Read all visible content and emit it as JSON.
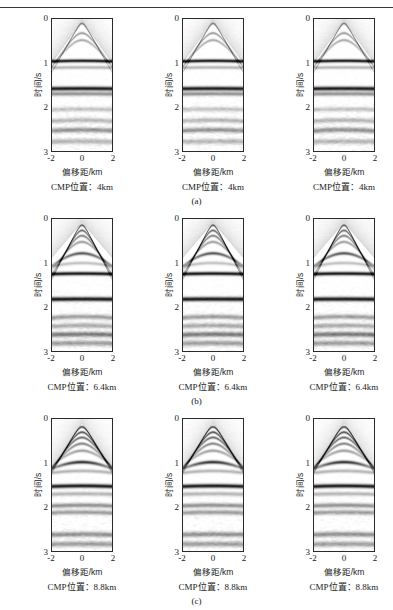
{
  "figure": {
    "rule": true,
    "axis": {
      "ylabel": "时间/s",
      "xlabel": "偏移距/km",
      "yticks": [
        "0",
        "1",
        "2",
        "3"
      ],
      "xticks": [
        "-2",
        "0",
        "2"
      ],
      "ylim": [
        0,
        3
      ],
      "xlim": [
        -2,
        2
      ]
    },
    "rows": [
      {
        "subcaption": "(a)",
        "cmp_label": "CMP位置：4km",
        "cmp_value": "4km",
        "panels": [
          {
            "cmp_label": "CMP位置：4km"
          },
          {
            "cmp_label": "CMP位置：4km"
          },
          {
            "cmp_label": "CMP位置：4km"
          }
        ]
      },
      {
        "subcaption": "(b)",
        "cmp_label": "CMP位置：6.4km",
        "cmp_value": "6.4km",
        "panels": [
          {
            "cmp_label": "CMP位置：6.4km"
          },
          {
            "cmp_label": "CMP位置：6.4km"
          },
          {
            "cmp_label": "CMP位置：6.4km"
          }
        ]
      },
      {
        "subcaption": "(c)",
        "cmp_label": "CMP位置：8.8km",
        "cmp_value": "8.8km",
        "panels": [
          {
            "cmp_label": "CMP位置：8.8km"
          },
          {
            "cmp_label": "CMP位置：8.8km"
          },
          {
            "cmp_label": "CMP位置：8.8km"
          }
        ]
      }
    ]
  },
  "chart_data": {
    "type": "heatmap",
    "title": "",
    "xlabel": "偏移距/km",
    "ylabel": "时间/s",
    "xlim": [
      -2,
      2
    ],
    "ylim": [
      0,
      3
    ],
    "xticks": [
      -2,
      0,
      2
    ],
    "yticks": [
      0,
      1,
      2,
      3
    ],
    "grid": false,
    "legend": null,
    "colormap": "grayscale",
    "panel_grid": {
      "rows": 3,
      "cols": 3
    },
    "row_labels": [
      "(a)",
      "(b)",
      "(c)"
    ],
    "row_cmp_positions_km": [
      4,
      6.4,
      8.8
    ],
    "panels": [
      {
        "row": 0,
        "col": 0,
        "cmp_km": 4,
        "reflectors": [
          {
            "t0": 0.1,
            "type": "hyperbola",
            "strength": 0.55,
            "curvature": 0.3
          },
          {
            "t0": 0.32,
            "type": "hyperbola",
            "strength": 0.4,
            "curvature": 0.26
          },
          {
            "t0": 0.48,
            "type": "hyperbola",
            "strength": 0.35,
            "curvature": 0.24
          },
          {
            "t0": 0.95,
            "type": "flat",
            "strength": 0.95,
            "curvature": 0.04
          },
          {
            "t0": 1.1,
            "type": "flat",
            "strength": 0.3,
            "curvature": 0.03
          },
          {
            "t0": 1.58,
            "type": "flat",
            "strength": 0.95,
            "curvature": 0.03
          },
          {
            "t0": 1.7,
            "type": "flat",
            "strength": 0.45,
            "curvature": 0.03
          },
          {
            "t0": 2.05,
            "type": "flat",
            "strength": 0.25,
            "curvature": 0.05
          },
          {
            "t0": 2.3,
            "type": "flat",
            "strength": 0.3,
            "curvature": 0.08
          },
          {
            "t0": 2.52,
            "type": "flat",
            "strength": 0.45,
            "curvature": 0.08
          },
          {
            "t0": 2.78,
            "type": "flat",
            "strength": 0.3,
            "curvature": 0.06
          }
        ],
        "fan_apex_t": 0.02,
        "fan_span_t": 0.95,
        "noise": 0.16
      },
      {
        "row": 0,
        "col": 1,
        "cmp_km": 4,
        "reflectors": [
          {
            "t0": 0.1,
            "type": "hyperbola",
            "strength": 0.55,
            "curvature": 0.3
          },
          {
            "t0": 0.32,
            "type": "hyperbola",
            "strength": 0.4,
            "curvature": 0.26
          },
          {
            "t0": 0.48,
            "type": "hyperbola",
            "strength": 0.35,
            "curvature": 0.24
          },
          {
            "t0": 0.95,
            "type": "flat",
            "strength": 0.95,
            "curvature": 0.04
          },
          {
            "t0": 1.1,
            "type": "flat",
            "strength": 0.3,
            "curvature": 0.03
          },
          {
            "t0": 1.58,
            "type": "flat",
            "strength": 0.95,
            "curvature": 0.03
          },
          {
            "t0": 1.7,
            "type": "flat",
            "strength": 0.45,
            "curvature": 0.03
          },
          {
            "t0": 2.05,
            "type": "flat",
            "strength": 0.25,
            "curvature": 0.05
          },
          {
            "t0": 2.3,
            "type": "flat",
            "strength": 0.3,
            "curvature": 0.08
          },
          {
            "t0": 2.52,
            "type": "flat",
            "strength": 0.45,
            "curvature": 0.08
          },
          {
            "t0": 2.78,
            "type": "flat",
            "strength": 0.3,
            "curvature": 0.06
          }
        ],
        "fan_apex_t": 0.02,
        "fan_span_t": 0.95,
        "noise": 0.16
      },
      {
        "row": 0,
        "col": 2,
        "cmp_km": 4,
        "reflectors": [
          {
            "t0": 0.1,
            "type": "hyperbola",
            "strength": 0.55,
            "curvature": 0.3
          },
          {
            "t0": 0.32,
            "type": "hyperbola",
            "strength": 0.4,
            "curvature": 0.26
          },
          {
            "t0": 0.48,
            "type": "hyperbola",
            "strength": 0.35,
            "curvature": 0.24
          },
          {
            "t0": 0.95,
            "type": "flat",
            "strength": 0.95,
            "curvature": 0.04
          },
          {
            "t0": 1.1,
            "type": "flat",
            "strength": 0.3,
            "curvature": 0.03
          },
          {
            "t0": 1.58,
            "type": "flat",
            "strength": 0.95,
            "curvature": 0.03
          },
          {
            "t0": 1.7,
            "type": "flat",
            "strength": 0.45,
            "curvature": 0.03
          },
          {
            "t0": 2.05,
            "type": "flat",
            "strength": 0.25,
            "curvature": 0.05
          },
          {
            "t0": 2.3,
            "type": "flat",
            "strength": 0.3,
            "curvature": 0.08
          },
          {
            "t0": 2.52,
            "type": "flat",
            "strength": 0.45,
            "curvature": 0.08
          },
          {
            "t0": 2.78,
            "type": "flat",
            "strength": 0.3,
            "curvature": 0.06
          }
        ],
        "fan_apex_t": 0.02,
        "fan_span_t": 0.95,
        "noise": 0.16
      },
      {
        "row": 1,
        "col": 0,
        "cmp_km": 6.4,
        "reflectors": [
          {
            "t0": 0.14,
            "type": "hyperbola",
            "strength": 0.7,
            "curvature": 0.34
          },
          {
            "t0": 0.26,
            "type": "hyperbola",
            "strength": 0.6,
            "curvature": 0.32
          },
          {
            "t0": 0.38,
            "type": "hyperbola",
            "strength": 0.5,
            "curvature": 0.3
          },
          {
            "t0": 0.52,
            "type": "hyperbola",
            "strength": 0.4,
            "curvature": 0.26
          },
          {
            "t0": 0.78,
            "type": "hyperbola",
            "strength": 0.7,
            "curvature": 0.18
          },
          {
            "t0": 1.0,
            "type": "flat",
            "strength": 0.25,
            "curvature": 0.1
          },
          {
            "t0": 1.24,
            "type": "flat",
            "strength": 0.95,
            "curvature": 0.04
          },
          {
            "t0": 1.82,
            "type": "flat",
            "strength": 0.95,
            "curvature": 0.03
          },
          {
            "t0": 2.22,
            "type": "flat",
            "strength": 0.4,
            "curvature": 0.08
          },
          {
            "t0": 2.42,
            "type": "flat",
            "strength": 0.35,
            "curvature": 0.08
          },
          {
            "t0": 2.62,
            "type": "flat",
            "strength": 0.55,
            "curvature": 0.06
          },
          {
            "t0": 2.82,
            "type": "flat",
            "strength": 0.4,
            "curvature": 0.06
          }
        ],
        "fan_apex_t": 0.05,
        "fan_span_t": 0.8,
        "noise": 0.15
      },
      {
        "row": 1,
        "col": 1,
        "cmp_km": 6.4,
        "reflectors": [
          {
            "t0": 0.14,
            "type": "hyperbola",
            "strength": 0.7,
            "curvature": 0.34
          },
          {
            "t0": 0.26,
            "type": "hyperbola",
            "strength": 0.6,
            "curvature": 0.32
          },
          {
            "t0": 0.38,
            "type": "hyperbola",
            "strength": 0.5,
            "curvature": 0.3
          },
          {
            "t0": 0.52,
            "type": "hyperbola",
            "strength": 0.4,
            "curvature": 0.26
          },
          {
            "t0": 0.78,
            "type": "hyperbola",
            "strength": 0.7,
            "curvature": 0.18
          },
          {
            "t0": 1.0,
            "type": "flat",
            "strength": 0.25,
            "curvature": 0.1
          },
          {
            "t0": 1.24,
            "type": "flat",
            "strength": 0.95,
            "curvature": 0.04
          },
          {
            "t0": 1.82,
            "type": "flat",
            "strength": 0.95,
            "curvature": 0.03
          },
          {
            "t0": 2.22,
            "type": "flat",
            "strength": 0.4,
            "curvature": 0.08
          },
          {
            "t0": 2.42,
            "type": "flat",
            "strength": 0.35,
            "curvature": 0.08
          },
          {
            "t0": 2.62,
            "type": "flat",
            "strength": 0.55,
            "curvature": 0.06
          },
          {
            "t0": 2.82,
            "type": "flat",
            "strength": 0.4,
            "curvature": 0.06
          }
        ],
        "fan_apex_t": 0.05,
        "fan_span_t": 0.8,
        "noise": 0.15
      },
      {
        "row": 1,
        "col": 2,
        "cmp_km": 6.4,
        "reflectors": [
          {
            "t0": 0.14,
            "type": "hyperbola",
            "strength": 0.7,
            "curvature": 0.34
          },
          {
            "t0": 0.26,
            "type": "hyperbola",
            "strength": 0.6,
            "curvature": 0.32
          },
          {
            "t0": 0.38,
            "type": "hyperbola",
            "strength": 0.5,
            "curvature": 0.3
          },
          {
            "t0": 0.52,
            "type": "hyperbola",
            "strength": 0.4,
            "curvature": 0.26
          },
          {
            "t0": 0.78,
            "type": "hyperbola",
            "strength": 0.7,
            "curvature": 0.18
          },
          {
            "t0": 1.0,
            "type": "flat",
            "strength": 0.25,
            "curvature": 0.1
          },
          {
            "t0": 1.24,
            "type": "flat",
            "strength": 0.95,
            "curvature": 0.04
          },
          {
            "t0": 1.82,
            "type": "flat",
            "strength": 0.95,
            "curvature": 0.03
          },
          {
            "t0": 2.22,
            "type": "flat",
            "strength": 0.4,
            "curvature": 0.08
          },
          {
            "t0": 2.42,
            "type": "flat",
            "strength": 0.35,
            "curvature": 0.08
          },
          {
            "t0": 2.62,
            "type": "flat",
            "strength": 0.55,
            "curvature": 0.06
          },
          {
            "t0": 2.82,
            "type": "flat",
            "strength": 0.4,
            "curvature": 0.06
          }
        ],
        "fan_apex_t": 0.05,
        "fan_span_t": 0.8,
        "noise": 0.15
      },
      {
        "row": 2,
        "col": 0,
        "cmp_km": 8.8,
        "reflectors": [
          {
            "t0": 0.18,
            "type": "hyperbola",
            "strength": 0.75,
            "curvature": 0.3
          },
          {
            "t0": 0.3,
            "type": "hyperbola",
            "strength": 0.7,
            "curvature": 0.28
          },
          {
            "t0": 0.42,
            "type": "hyperbola",
            "strength": 0.6,
            "curvature": 0.26
          },
          {
            "t0": 0.56,
            "type": "hyperbola",
            "strength": 0.5,
            "curvature": 0.24
          },
          {
            "t0": 0.72,
            "type": "hyperbola",
            "strength": 0.4,
            "curvature": 0.2
          },
          {
            "t0": 0.98,
            "type": "hyperbola",
            "strength": 0.85,
            "curvature": 0.14
          },
          {
            "t0": 1.18,
            "type": "flat",
            "strength": 0.3,
            "curvature": 0.08
          },
          {
            "t0": 1.52,
            "type": "flat",
            "strength": 0.95,
            "curvature": 0.05
          },
          {
            "t0": 1.7,
            "type": "flat",
            "strength": 0.3,
            "curvature": 0.05
          },
          {
            "t0": 1.96,
            "type": "flat",
            "strength": 0.45,
            "curvature": 0.06
          },
          {
            "t0": 2.12,
            "type": "flat",
            "strength": 0.4,
            "curvature": 0.06
          },
          {
            "t0": 2.62,
            "type": "flat",
            "strength": 0.45,
            "curvature": 0.06
          },
          {
            "t0": 2.84,
            "type": "flat",
            "strength": 0.4,
            "curvature": 0.05
          }
        ],
        "fan_apex_t": 0.08,
        "fan_span_t": 1.0,
        "noise": 0.14
      },
      {
        "row": 2,
        "col": 1,
        "cmp_km": 8.8,
        "reflectors": [
          {
            "t0": 0.18,
            "type": "hyperbola",
            "strength": 0.75,
            "curvature": 0.3
          },
          {
            "t0": 0.3,
            "type": "hyperbola",
            "strength": 0.7,
            "curvature": 0.28
          },
          {
            "t0": 0.42,
            "type": "hyperbola",
            "strength": 0.6,
            "curvature": 0.26
          },
          {
            "t0": 0.56,
            "type": "hyperbola",
            "strength": 0.5,
            "curvature": 0.24
          },
          {
            "t0": 0.72,
            "type": "hyperbola",
            "strength": 0.4,
            "curvature": 0.2
          },
          {
            "t0": 0.98,
            "type": "hyperbola",
            "strength": 0.85,
            "curvature": 0.14
          },
          {
            "t0": 1.18,
            "type": "flat",
            "strength": 0.3,
            "curvature": 0.08
          },
          {
            "t0": 1.52,
            "type": "flat",
            "strength": 0.95,
            "curvature": 0.05
          },
          {
            "t0": 1.7,
            "type": "flat",
            "strength": 0.3,
            "curvature": 0.05
          },
          {
            "t0": 1.96,
            "type": "flat",
            "strength": 0.45,
            "curvature": 0.06
          },
          {
            "t0": 2.12,
            "type": "flat",
            "strength": 0.4,
            "curvature": 0.06
          },
          {
            "t0": 2.62,
            "type": "flat",
            "strength": 0.45,
            "curvature": 0.06
          },
          {
            "t0": 2.84,
            "type": "flat",
            "strength": 0.4,
            "curvature": 0.05
          }
        ],
        "fan_apex_t": 0.08,
        "fan_span_t": 1.0,
        "noise": 0.14
      },
      {
        "row": 2,
        "col": 2,
        "cmp_km": 8.8,
        "reflectors": [
          {
            "t0": 0.18,
            "type": "hyperbola",
            "strength": 0.75,
            "curvature": 0.3
          },
          {
            "t0": 0.3,
            "type": "hyperbola",
            "strength": 0.7,
            "curvature": 0.28
          },
          {
            "t0": 0.42,
            "type": "hyperbola",
            "strength": 0.6,
            "curvature": 0.26
          },
          {
            "t0": 0.56,
            "type": "hyperbola",
            "strength": 0.5,
            "curvature": 0.24
          },
          {
            "t0": 0.72,
            "type": "hyperbola",
            "strength": 0.4,
            "curvature": 0.2
          },
          {
            "t0": 0.98,
            "type": "hyperbola",
            "strength": 0.85,
            "curvature": 0.14
          },
          {
            "t0": 1.18,
            "type": "flat",
            "strength": 0.3,
            "curvature": 0.08
          },
          {
            "t0": 1.52,
            "type": "flat",
            "strength": 0.95,
            "curvature": 0.05
          },
          {
            "t0": 1.7,
            "type": "flat",
            "strength": 0.3,
            "curvature": 0.05
          },
          {
            "t0": 1.96,
            "type": "flat",
            "strength": 0.45,
            "curvature": 0.06
          },
          {
            "t0": 2.12,
            "type": "flat",
            "strength": 0.4,
            "curvature": 0.06
          },
          {
            "t0": 2.62,
            "type": "flat",
            "strength": 0.45,
            "curvature": 0.06
          },
          {
            "t0": 2.84,
            "type": "flat",
            "strength": 0.4,
            "curvature": 0.05
          }
        ],
        "fan_apex_t": 0.08,
        "fan_span_t": 1.0,
        "noise": 0.14
      }
    ]
  }
}
